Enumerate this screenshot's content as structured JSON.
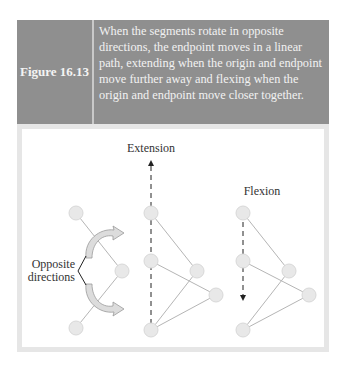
{
  "figure": {
    "label": "Figure 16.13",
    "caption": "When the segments rotate in opposite directions, the endpoint moves in a linear path, extending when the origin and endpoint move further away and flexing when the origin and endpoint move closer together."
  },
  "diagram": {
    "labels": {
      "extension": "Extension",
      "flexion": "Flexion",
      "opposite_line1": "Opposite",
      "opposite_line2": "directions"
    },
    "colors": {
      "header_bg": "#8f8f8f",
      "panel_border": "#e6e6e6",
      "node_fill": "#e8e8e8",
      "segment": "#b5b5b5",
      "arrow_fill": "#dcdcdc"
    }
  }
}
